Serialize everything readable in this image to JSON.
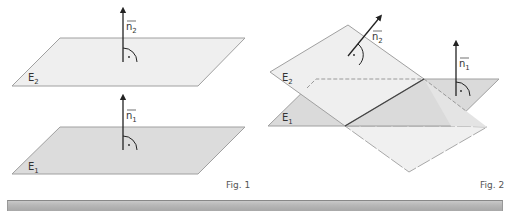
{
  "figures": [
    {
      "caption": "Fig. 1",
      "planes": [
        {
          "label_main": "E",
          "label_sub": "2"
        },
        {
          "label_main": "E",
          "label_sub": "1"
        }
      ],
      "normals": [
        {
          "label_main": "n",
          "label_sub": "2"
        },
        {
          "label_main": "n",
          "label_sub": "1"
        }
      ],
      "description": "Two parallel planes E1 and E2 with parallel normal vectors n1 and n2"
    },
    {
      "caption": "Fig. 2",
      "planes": [
        {
          "label_main": "E",
          "label_sub": "2"
        },
        {
          "label_main": "E",
          "label_sub": "1"
        }
      ],
      "normals": [
        {
          "label_main": "n",
          "label_sub": "2"
        },
        {
          "label_main": "n",
          "label_sub": "1"
        }
      ],
      "description": "Two intersecting planes E1 and E2 with intersection line and non-parallel normal vectors"
    }
  ],
  "colors": {
    "plane_light": "#efefef",
    "plane_dark": "#dadada",
    "edge": "#9a9a9a",
    "arrow": "#222222",
    "intersection_line": "#444444"
  }
}
